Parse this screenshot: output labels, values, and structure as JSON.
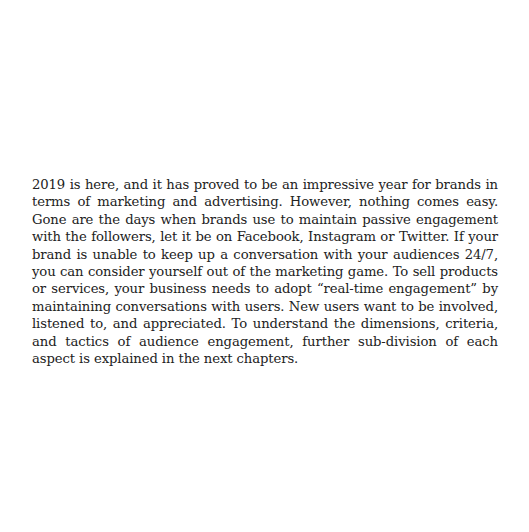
{
  "document": {
    "paragraph": "2019 is here, and it has proved to be an impressive year for brands in terms of marketing and advertising. However, nothing comes easy. Gone are the days when brands use to maintain passive engagement with the followers, let it be on Facebook, Instagram or Twitter. If your brand is unable to keep up a conversation with your audiences 24/7, you can consider yourself out of the marketing game. To sell products or services, your business needs to adopt “real-time engagement” by maintaining conversations with users. New users want to be involved, listened to, and appreciated. To understand the dimensions, criteria, and tactics of audience engagement, further sub-division of each aspect is explained in the next chapters."
  }
}
